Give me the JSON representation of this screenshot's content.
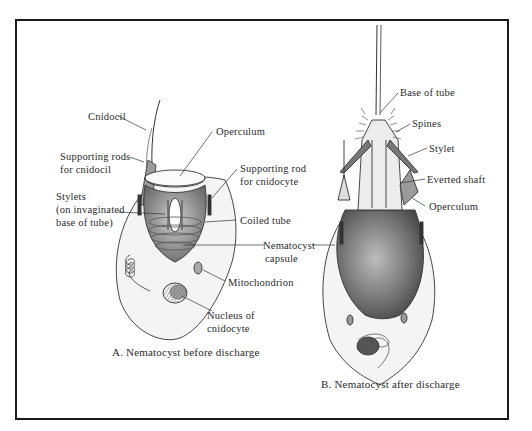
{
  "figure": {
    "panels": [
      {
        "id": "A",
        "caption": "A. Nematocyst before discharge",
        "labels": {
          "cnidocil": "Cnidocil",
          "supporting_rods_1": "Supporting rods",
          "supporting_rods_2": "for cnidocil",
          "operculum": "Operculum",
          "supporting_rod_cnidocyte_1": "Supporting rod",
          "supporting_rod_cnidocyte_2": "for cnidocyte",
          "stylets_1": "Stylets",
          "stylets_2": "(on invaginated",
          "stylets_3": "base of tube)",
          "coiled_tube": "Coiled tube",
          "nematocyst_capsule_1": "Nematocyst",
          "nematocyst_capsule_2": "capsule",
          "mitochondrion": "Mitochondrion",
          "nucleus_1": "Nucleus of",
          "nucleus_2": "cnidocyte"
        }
      },
      {
        "id": "B",
        "caption": "B. Nematocyst after discharge",
        "labels": {
          "base_of_tube": "Base of tube",
          "spines": "Spines",
          "stylet": "Stylet",
          "everted_shaft": "Everted shaft",
          "operculum": "Operculum"
        }
      }
    ],
    "colors": {
      "ink": "#2a2a2a",
      "frame": "#1a1a1a",
      "shade": "#8a8a8a"
    }
  }
}
